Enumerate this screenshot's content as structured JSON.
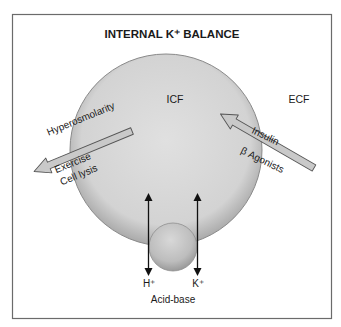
{
  "title": "INTERNAL K⁺ BALANCE",
  "compartments": {
    "icf": "ICF",
    "ecf": "ECF"
  },
  "efflux_arrow": {
    "direction": "ICF to ECF",
    "above_label": "Hyperosmolarity",
    "below_label_1": "Exercise",
    "below_label_2": "Cell lysis"
  },
  "influx_arrow": {
    "direction": "ECF to ICF",
    "above_label": "Insulin",
    "below_label": "β Agonists"
  },
  "exchanger": {
    "left_ion": "H⁺",
    "right_ion": "K⁺",
    "caption": "Acid-base"
  },
  "colors": {
    "border": "#6b6b6b",
    "cell_fill": "#d2d2d2",
    "cell_edge": "#8a8a8a",
    "arrow_fill": "#c9c9c9",
    "arrow_stroke": "#555555",
    "ion_arrow": "#111111"
  }
}
